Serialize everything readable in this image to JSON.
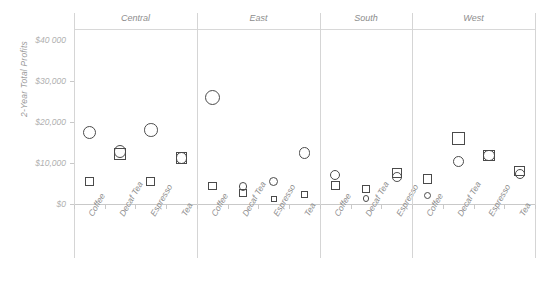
{
  "chart_data": {
    "type": "scatter",
    "title": "",
    "ylabel": "2-Year Total Profits",
    "xlabel": "",
    "ylim": [
      0,
      40000
    ],
    "ytick_labels": [
      "$40 000",
      "$30,000",
      "$20,000",
      "$10,000",
      "$0"
    ],
    "ytick_values": [
      40000,
      30000,
      20000,
      10000,
      0
    ],
    "grid": false,
    "legend": "none",
    "panel_variable": "Region",
    "panels": [
      {
        "name": "Central",
        "categories": [
          "Coffee",
          "Decaf Tea",
          "Espresso",
          "Tea"
        ],
        "series": [
          {
            "name": "circle",
            "marker": "circle",
            "values": [
              17500,
              12800,
              18000,
              11200
            ]
          },
          {
            "name": "square",
            "marker": "square",
            "values": [
              5400,
              12100,
              5400,
              11200
            ]
          }
        ]
      },
      {
        "name": "East",
        "categories": [
          "Coffee",
          "Decaf Tea",
          "Espresso",
          "Tea"
        ],
        "series": [
          {
            "name": "circle",
            "marker": "circle",
            "values": [
              26000,
              4200,
              5500,
              12400
            ]
          },
          {
            "name": "square",
            "marker": "square",
            "values": [
              4400,
              2700,
              1200,
              2300
            ]
          }
        ]
      },
      {
        "name": "South",
        "categories": [
          "Coffee",
          "Decaf Tea",
          "Espresso"
        ],
        "series": [
          {
            "name": "circle",
            "marker": "circle",
            "values": [
              7100,
              1400,
              6600
            ]
          },
          {
            "name": "square",
            "marker": "square",
            "values": [
              4500,
              3600,
              7500
            ]
          }
        ]
      },
      {
        "name": "West",
        "categories": [
          "Coffee",
          "Decaf Tea",
          "Espresso",
          "Tea"
        ],
        "series": [
          {
            "name": "circle",
            "marker": "circle",
            "values": [
              2100,
              10400,
              11800,
              7300
            ]
          },
          {
            "name": "square",
            "marker": "square",
            "values": [
              6100,
              16000,
              11800,
              8100
            ]
          }
        ]
      }
    ],
    "colors": {
      "marker_stroke": "#4a4a4a",
      "axis": "#c9c9c9",
      "tick_text": "#b0b0b0",
      "panel_title": "#8d8d8d",
      "background": "#ffffff"
    }
  }
}
